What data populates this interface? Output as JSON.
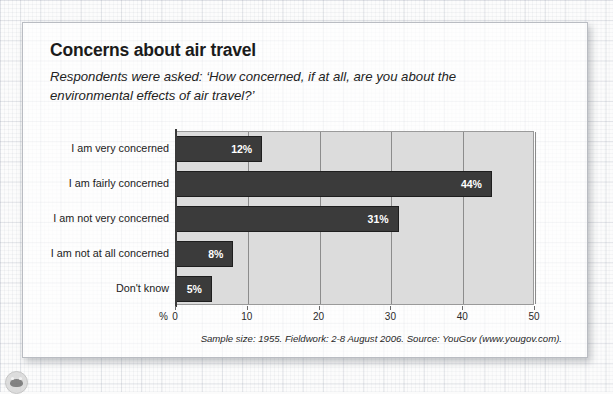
{
  "page": {
    "title": "Concerns about air travel",
    "subtitle": "Respondents were asked: ‘How concerned, if at all, are you about the environmental effects of air travel?’",
    "footnote": "Sample size: 1955. Fieldwork: 2-8 August 2006. Source: YouGov (www.yougov.com).",
    "emblem_icon": "circular-emblem-icon"
  },
  "colors": {
    "bar_fill": "#3b3b3b",
    "bar_stroke": "#1e1e1e",
    "plot_background": "#dcdcdc",
    "gridline": "#8c8c8c",
    "axis_line": "#3a3a3a",
    "data_label_text": "#ffffff",
    "card_border": "#b9bcc2"
  },
  "chart_data": {
    "type": "bar",
    "orientation": "horizontal",
    "title": "Concerns about air travel",
    "subtitle": "Respondents were asked: ‘How concerned, if at all, are you about the environmental effects of air travel?’",
    "xlabel": "%",
    "ylabel": "",
    "categories": [
      "I am very concerned",
      "I am fairly concerned",
      "I am not very concerned",
      "I am not at all concerned",
      "Don't know"
    ],
    "values": [
      12,
      44,
      31,
      8,
      5
    ],
    "data_labels": [
      "12%",
      "44%",
      "31%",
      "8%",
      "5%"
    ],
    "xlim": [
      0,
      50
    ],
    "xticks": [
      0,
      10,
      20,
      30,
      40,
      50
    ],
    "xtick_labels": [
      "0",
      "10",
      "20",
      "30",
      "40",
      "50"
    ],
    "grid": "vertical",
    "legend": "none",
    "unit": "%"
  }
}
